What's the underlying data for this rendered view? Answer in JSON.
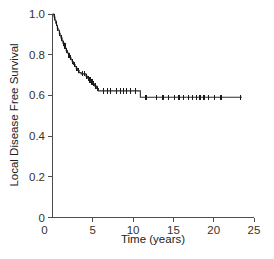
{
  "chart_data": {
    "type": "line",
    "subtype": "kaplan-meier-step",
    "title": "",
    "subtitle": "",
    "xlabel": "Time (years)",
    "ylabel": "Local Disease Free Survival",
    "xlim": [
      0,
      25
    ],
    "ylim": [
      0,
      1.0
    ],
    "xticks": [
      0,
      5,
      10,
      15,
      20,
      25
    ],
    "xtick_labels": [
      "0",
      "5",
      "10",
      "15",
      "20",
      "25"
    ],
    "yticks": [
      0,
      0.2,
      0.4,
      0.6,
      0.8,
      1.0
    ],
    "ytick_labels": [
      "0",
      "0.2",
      "0.4",
      "0.6",
      "0.8",
      "1.0"
    ],
    "grid": false,
    "legend": null,
    "legend_position": "none",
    "line_color": "#2b2b2b",
    "axis_color": "#4d4d4d",
    "series": [
      {
        "name": "Local Disease Free Survival",
        "step": "post",
        "points": [
          {
            "x": 0.0,
            "y": 1.0
          },
          {
            "x": 0.15,
            "y": 0.995
          },
          {
            "x": 0.2,
            "y": 0.985
          },
          {
            "x": 0.3,
            "y": 0.97
          },
          {
            "x": 0.4,
            "y": 0.955
          },
          {
            "x": 0.5,
            "y": 0.945
          },
          {
            "x": 0.6,
            "y": 0.93
          },
          {
            "x": 0.7,
            "y": 0.92
          },
          {
            "x": 0.85,
            "y": 0.905
          },
          {
            "x": 0.95,
            "y": 0.893
          },
          {
            "x": 1.05,
            "y": 0.882
          },
          {
            "x": 1.2,
            "y": 0.868
          },
          {
            "x": 1.3,
            "y": 0.857
          },
          {
            "x": 1.45,
            "y": 0.843
          },
          {
            "x": 1.6,
            "y": 0.832
          },
          {
            "x": 1.7,
            "y": 0.82
          },
          {
            "x": 1.85,
            "y": 0.808
          },
          {
            "x": 2.0,
            "y": 0.796
          },
          {
            "x": 2.15,
            "y": 0.785
          },
          {
            "x": 2.3,
            "y": 0.775
          },
          {
            "x": 2.45,
            "y": 0.765
          },
          {
            "x": 2.6,
            "y": 0.752
          },
          {
            "x": 2.8,
            "y": 0.742
          },
          {
            "x": 2.95,
            "y": 0.733
          },
          {
            "x": 3.1,
            "y": 0.722
          },
          {
            "x": 3.3,
            "y": 0.712
          },
          {
            "x": 3.55,
            "y": 0.706
          },
          {
            "x": 4.05,
            "y": 0.706
          },
          {
            "x": 4.15,
            "y": 0.694
          },
          {
            "x": 4.35,
            "y": 0.685
          },
          {
            "x": 4.55,
            "y": 0.676
          },
          {
            "x": 4.8,
            "y": 0.666
          },
          {
            "x": 5.0,
            "y": 0.657
          },
          {
            "x": 5.2,
            "y": 0.646
          },
          {
            "x": 5.45,
            "y": 0.634
          },
          {
            "x": 5.7,
            "y": 0.622
          },
          {
            "x": 10.8,
            "y": 0.622
          },
          {
            "x": 10.9,
            "y": 0.591
          },
          {
            "x": 23.5,
            "y": 0.591
          }
        ],
        "censored": [
          {
            "x": 0.25,
            "y": 0.985
          },
          {
            "x": 0.45,
            "y": 0.955
          },
          {
            "x": 0.65,
            "y": 0.93
          },
          {
            "x": 0.9,
            "y": 0.905
          },
          {
            "x": 1.1,
            "y": 0.882
          },
          {
            "x": 1.35,
            "y": 0.857
          },
          {
            "x": 1.55,
            "y": 0.843
          },
          {
            "x": 1.78,
            "y": 0.82
          },
          {
            "x": 2.05,
            "y": 0.796
          },
          {
            "x": 2.25,
            "y": 0.785
          },
          {
            "x": 2.5,
            "y": 0.765
          },
          {
            "x": 2.72,
            "y": 0.752
          },
          {
            "x": 3.0,
            "y": 0.733
          },
          {
            "x": 3.2,
            "y": 0.722
          },
          {
            "x": 3.75,
            "y": 0.706
          },
          {
            "x": 3.95,
            "y": 0.706
          },
          {
            "x": 4.25,
            "y": 0.694
          },
          {
            "x": 4.45,
            "y": 0.685
          },
          {
            "x": 4.65,
            "y": 0.676
          },
          {
            "x": 4.9,
            "y": 0.666
          },
          {
            "x": 5.1,
            "y": 0.657
          },
          {
            "x": 5.3,
            "y": 0.646
          },
          {
            "x": 5.55,
            "y": 0.634
          },
          {
            "x": 6.3,
            "y": 0.622
          },
          {
            "x": 6.8,
            "y": 0.622
          },
          {
            "x": 7.2,
            "y": 0.622
          },
          {
            "x": 7.9,
            "y": 0.622
          },
          {
            "x": 8.4,
            "y": 0.622
          },
          {
            "x": 8.8,
            "y": 0.622
          },
          {
            "x": 9.2,
            "y": 0.622
          },
          {
            "x": 9.7,
            "y": 0.622
          },
          {
            "x": 10.3,
            "y": 0.622
          },
          {
            "x": 11.6,
            "y": 0.591
          },
          {
            "x": 12.9,
            "y": 0.591
          },
          {
            "x": 13.7,
            "y": 0.591
          },
          {
            "x": 14.4,
            "y": 0.591
          },
          {
            "x": 15.1,
            "y": 0.591
          },
          {
            "x": 15.7,
            "y": 0.591
          },
          {
            "x": 16.3,
            "y": 0.591
          },
          {
            "x": 16.9,
            "y": 0.591
          },
          {
            "x": 17.4,
            "y": 0.591
          },
          {
            "x": 17.9,
            "y": 0.591
          },
          {
            "x": 18.3,
            "y": 0.591
          },
          {
            "x": 18.8,
            "y": 0.591
          },
          {
            "x": 19.4,
            "y": 0.591
          },
          {
            "x": 20.1,
            "y": 0.591
          },
          {
            "x": 20.9,
            "y": 0.591
          },
          {
            "x": 23.3,
            "y": 0.591
          }
        ]
      }
    ]
  }
}
